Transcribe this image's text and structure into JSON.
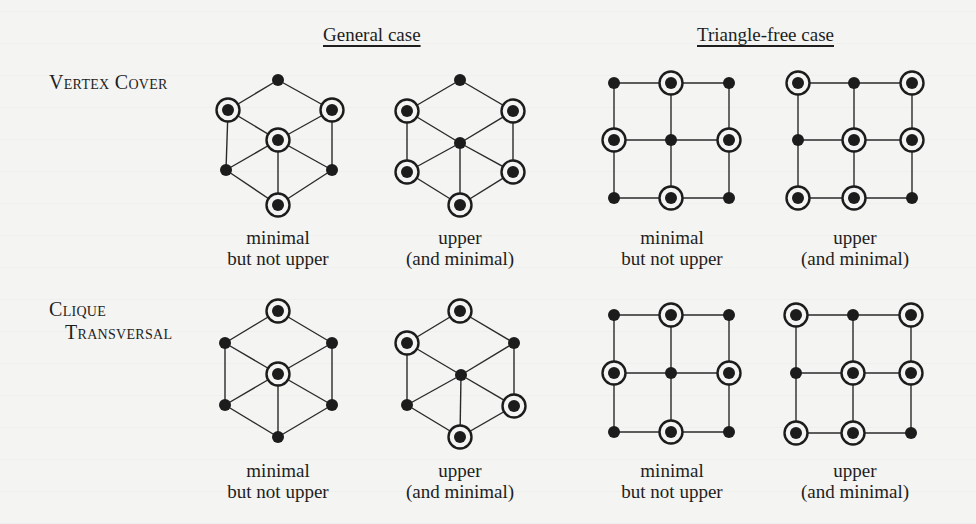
{
  "headings": {
    "general": "General case",
    "triangle_free": "Triangle-free case"
  },
  "rows": [
    {
      "label_lines": [
        "Vertex Cover"
      ]
    },
    {
      "label_lines": [
        "Clique",
        "Transversal"
      ]
    }
  ],
  "captions": {
    "minimal": [
      "minimal",
      "but not upper"
    ],
    "upper": [
      "upper",
      "(and minimal)"
    ]
  },
  "colors": {
    "vertex": "#1c1c1c",
    "edge": "#2a2a2a",
    "background": "#f4f4f2"
  },
  "graphs": [
    {
      "id": "vc-general-minimal",
      "row": "Vertex Cover",
      "case": "General case",
      "caption": "minimal",
      "vertices": [
        [
          278,
          80,
          0
        ],
        [
          228,
          110,
          1
        ],
        [
          332,
          110,
          1
        ],
        [
          278,
          140,
          1
        ],
        [
          226,
          170,
          0
        ],
        [
          332,
          170,
          0
        ],
        [
          278,
          205,
          1
        ]
      ],
      "edges": [
        [
          0,
          1
        ],
        [
          0,
          2
        ],
        [
          1,
          3
        ],
        [
          2,
          3
        ],
        [
          1,
          4
        ],
        [
          2,
          5
        ],
        [
          3,
          4
        ],
        [
          3,
          5
        ],
        [
          3,
          6
        ],
        [
          4,
          6
        ],
        [
          5,
          6
        ]
      ]
    },
    {
      "id": "vc-general-upper",
      "row": "Vertex Cover",
      "case": "General case",
      "caption": "upper",
      "vertices": [
        [
          460,
          80,
          0
        ],
        [
          407,
          111,
          1
        ],
        [
          513,
          111,
          1
        ],
        [
          460,
          143,
          0
        ],
        [
          407,
          172,
          1
        ],
        [
          513,
          172,
          1
        ],
        [
          460,
          205,
          1
        ]
      ],
      "edges": [
        [
          0,
          1
        ],
        [
          0,
          2
        ],
        [
          1,
          3
        ],
        [
          2,
          3
        ],
        [
          1,
          4
        ],
        [
          2,
          5
        ],
        [
          3,
          4
        ],
        [
          3,
          5
        ],
        [
          3,
          6
        ],
        [
          4,
          6
        ],
        [
          5,
          6
        ]
      ]
    },
    {
      "id": "ct-general-minimal",
      "row": "Clique Transversal",
      "case": "General case",
      "caption": "minimal",
      "vertices": [
        [
          278,
          311,
          1
        ],
        [
          225,
          343,
          0
        ],
        [
          332,
          343,
          0
        ],
        [
          278,
          374,
          1
        ],
        [
          225,
          405,
          0
        ],
        [
          332,
          405,
          0
        ],
        [
          278,
          437,
          0
        ]
      ],
      "edges": [
        [
          0,
          1
        ],
        [
          0,
          2
        ],
        [
          1,
          3
        ],
        [
          2,
          3
        ],
        [
          1,
          4
        ],
        [
          2,
          5
        ],
        [
          3,
          4
        ],
        [
          3,
          5
        ],
        [
          3,
          6
        ],
        [
          4,
          6
        ],
        [
          5,
          6
        ]
      ]
    },
    {
      "id": "ct-general-upper",
      "row": "Clique Transversal",
      "case": "General case",
      "caption": "upper",
      "vertices": [
        [
          460,
          311,
          1
        ],
        [
          407,
          343,
          1
        ],
        [
          514,
          343,
          0
        ],
        [
          461,
          375,
          0
        ],
        [
          407,
          405,
          0
        ],
        [
          514,
          406,
          1
        ],
        [
          460,
          437,
          1
        ]
      ],
      "edges": [
        [
          0,
          1
        ],
        [
          0,
          2
        ],
        [
          1,
          3
        ],
        [
          2,
          3
        ],
        [
          1,
          4
        ],
        [
          2,
          5
        ],
        [
          3,
          4
        ],
        [
          3,
          5
        ],
        [
          3,
          6
        ],
        [
          4,
          6
        ],
        [
          5,
          6
        ]
      ]
    },
    {
      "id": "vc-trianglefree-minimal",
      "row": "Vertex Cover",
      "case": "Triangle-free case",
      "caption": "minimal",
      "grid": {
        "xs": [
          614,
          671,
          729
        ],
        "ys": [
          83,
          140,
          198
        ]
      },
      "circled": [
        [
          0,
          1
        ],
        [
          1,
          0
        ],
        [
          1,
          2
        ],
        [
          2,
          1
        ]
      ]
    },
    {
      "id": "vc-trianglefree-upper",
      "row": "Vertex Cover",
      "case": "Triangle-free case",
      "caption": "upper",
      "grid": {
        "xs": [
          798,
          854,
          912
        ],
        "ys": [
          83,
          140,
          198
        ]
      },
      "circled": [
        [
          0,
          0
        ],
        [
          0,
          2
        ],
        [
          1,
          1
        ],
        [
          1,
          2
        ],
        [
          2,
          0
        ],
        [
          2,
          1
        ]
      ]
    },
    {
      "id": "ct-trianglefree-minimal",
      "row": "Clique Transversal",
      "case": "Triangle-free case",
      "caption": "minimal",
      "grid": {
        "xs": [
          614,
          671,
          729
        ],
        "ys": [
          315,
          373,
          432
        ]
      },
      "circled": [
        [
          0,
          1
        ],
        [
          1,
          0
        ],
        [
          1,
          2
        ],
        [
          2,
          1
        ]
      ]
    },
    {
      "id": "ct-trianglefree-upper",
      "row": "Clique Transversal",
      "case": "Triangle-free case",
      "caption": "upper",
      "grid": {
        "xs": [
          796,
          853,
          911
        ],
        "ys": [
          315,
          373,
          433
        ]
      },
      "circled": [
        [
          0,
          0
        ],
        [
          0,
          2
        ],
        [
          1,
          1
        ],
        [
          1,
          2
        ],
        [
          2,
          0
        ],
        [
          2,
          1
        ]
      ]
    }
  ]
}
